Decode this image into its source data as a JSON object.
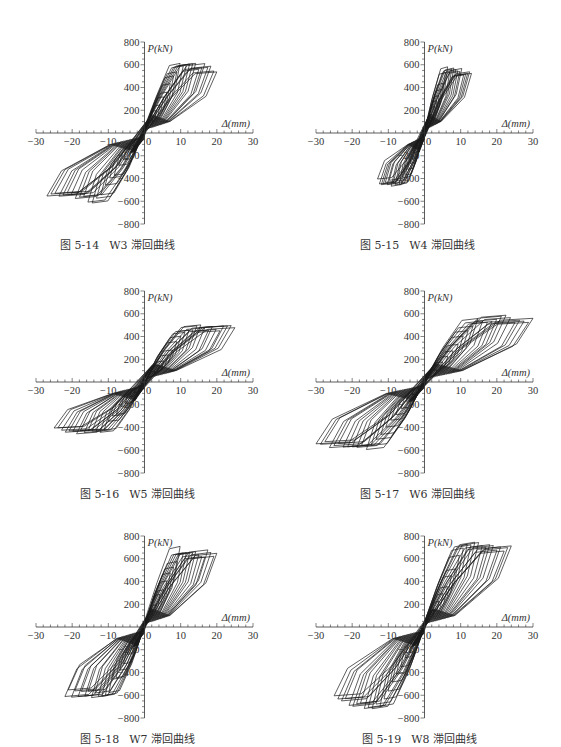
{
  "figures": [
    {
      "id": "W3",
      "caption_num": "图 5-14",
      "caption_text": "W3 滞回曲线",
      "peak_pos": [
        8,
        640
      ],
      "peak_neg": [
        -26,
        -600
      ],
      "max_disp": 20,
      "min_disp": -27,
      "pos_end": 360,
      "neg_end": -420
    },
    {
      "id": "W4",
      "caption_num": "图 5-15",
      "caption_text": "W4 滞回曲线",
      "peak_pos": [
        7,
        580
      ],
      "peak_neg": [
        -10,
        -460
      ],
      "max_disp": 13,
      "min_disp": -13,
      "pos_end": 440,
      "neg_end": -380
    },
    {
      "id": "W5",
      "caption_num": "图 5-16",
      "caption_text": "W5 滞回曲线",
      "peak_pos": [
        13,
        490
      ],
      "peak_neg": [
        -3,
        -460
      ],
      "max_disp": 25,
      "min_disp": -25,
      "pos_end": 480,
      "neg_end": -330
    },
    {
      "id": "W6",
      "caption_num": "图 5-17",
      "caption_text": "W6 滞回曲线",
      "peak_pos": [
        13,
        570
      ],
      "peak_neg": [
        -10,
        -580
      ],
      "max_disp": 30,
      "min_disp": -30,
      "pos_end": 560,
      "neg_end": -470
    },
    {
      "id": "W7",
      "caption_num": "图 5-18",
      "caption_text": "W7 滞回曲线",
      "peak_pos": [
        7,
        690
      ],
      "peak_neg": [
        -10,
        -620
      ],
      "max_disp": 20,
      "min_disp": -22,
      "pos_end": 560,
      "neg_end": -540
    },
    {
      "id": "W8",
      "caption_num": "图 5-19",
      "caption_text": "W8 滞回曲线",
      "peak_pos": [
        11,
        760
      ],
      "peak_neg": [
        -11,
        -720
      ],
      "max_disp": 24,
      "min_disp": -25,
      "pos_end": 600,
      "neg_end": -470
    }
  ],
  "chart_data": [
    {
      "type": "line",
      "title": "图 5-14 W3 滞回曲线",
      "xlabel": "Δ(mm)",
      "ylabel": "P(kN)",
      "xlim": [
        -30,
        30
      ],
      "ylim": [
        -800,
        800
      ],
      "xticks": [
        -30,
        -20,
        -10,
        0,
        10,
        20,
        30
      ],
      "yticks": [
        -800,
        -600,
        -400,
        -200,
        0,
        200,
        400,
        600,
        800
      ],
      "grid": false,
      "series": [
        {
          "name": "W3",
          "peak_positive": {
            "x": 8,
            "y": 640
          },
          "peak_negative": {
            "x": -26,
            "y": -600
          }
        }
      ]
    },
    {
      "type": "line",
      "title": "图 5-15 W4 滞回曲线",
      "xlabel": "Δ(mm)",
      "ylabel": "P(kN)",
      "xlim": [
        -30,
        30
      ],
      "ylim": [
        -800,
        800
      ],
      "xticks": [
        -30,
        -20,
        -10,
        0,
        10,
        20,
        30
      ],
      "yticks": [
        -800,
        -600,
        -400,
        -200,
        0,
        200,
        400,
        600,
        800
      ],
      "grid": false,
      "series": [
        {
          "name": "W4",
          "peak_positive": {
            "x": 7,
            "y": 580
          },
          "peak_negative": {
            "x": -10,
            "y": -460
          }
        }
      ]
    },
    {
      "type": "line",
      "title": "图 5-16 W5 滞回曲线",
      "xlabel": "Δ(mm)",
      "ylabel": "P(kN)",
      "xlim": [
        -30,
        30
      ],
      "ylim": [
        -800,
        800
      ],
      "xticks": [
        -30,
        -20,
        -10,
        0,
        10,
        20,
        30
      ],
      "yticks": [
        -800,
        -600,
        -400,
        -200,
        0,
        200,
        400,
        600,
        800
      ],
      "grid": false,
      "series": [
        {
          "name": "W5",
          "peak_positive": {
            "x": 13,
            "y": 490
          },
          "peak_negative": {
            "x": -3,
            "y": -460
          }
        }
      ]
    },
    {
      "type": "line",
      "title": "图 5-17 W6 滞回曲线",
      "xlabel": "Δ(mm)",
      "ylabel": "P(kN)",
      "xlim": [
        -30,
        30
      ],
      "ylim": [
        -800,
        800
      ],
      "xticks": [
        -30,
        -20,
        -10,
        0,
        10,
        20,
        30
      ],
      "yticks": [
        -800,
        -600,
        -400,
        -200,
        0,
        200,
        400,
        600,
        800
      ],
      "grid": false,
      "series": [
        {
          "name": "W6",
          "peak_positive": {
            "x": 13,
            "y": 570
          },
          "peak_negative": {
            "x": -10,
            "y": -580
          }
        }
      ]
    },
    {
      "type": "line",
      "title": "图 5-18 W7 滞回曲线",
      "xlabel": "Δ(mm)",
      "ylabel": "P(kN)",
      "xlim": [
        -30,
        30
      ],
      "ylim": [
        -800,
        800
      ],
      "xticks": [
        -30,
        -20,
        -10,
        0,
        10,
        20,
        30
      ],
      "yticks": [
        -800,
        -600,
        -400,
        -200,
        0,
        200,
        400,
        600,
        800
      ],
      "grid": false,
      "series": [
        {
          "name": "W7",
          "peak_positive": {
            "x": 7,
            "y": 690
          },
          "peak_negative": {
            "x": -10,
            "y": -620
          }
        }
      ]
    },
    {
      "type": "line",
      "title": "图 5-19 W8 滞回曲线",
      "xlabel": "Δ(mm)",
      "ylabel": "P(kN)",
      "xlim": [
        -30,
        30
      ],
      "ylim": [
        -800,
        800
      ],
      "xticks": [
        -30,
        -20,
        -10,
        0,
        10,
        20,
        30
      ],
      "yticks": [
        -800,
        -600,
        -400,
        -200,
        0,
        200,
        400,
        600,
        800
      ],
      "grid": false,
      "series": [
        {
          "name": "W8",
          "peak_positive": {
            "x": 11,
            "y": 760
          },
          "peak_negative": {
            "x": -11,
            "y": -720
          }
        }
      ]
    }
  ]
}
